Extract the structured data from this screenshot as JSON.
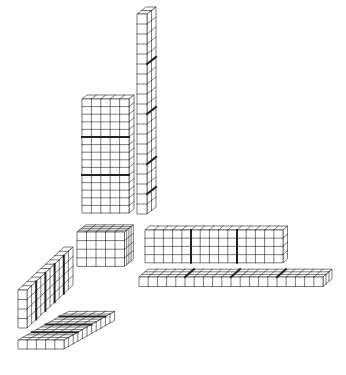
{
  "figure": {
    "width": 346,
    "height": 375,
    "background": "#ffffff",
    "line_color": "#222222",
    "face_color": "#ffffff",
    "thin_stroke": 0.6,
    "thick_stroke": 2.0
  },
  "blocks": [
    {
      "name": "tall-column",
      "x": 137,
      "y": 14,
      "cols": 1,
      "rows": 20,
      "depth": 2,
      "cw": 10,
      "rh": 10,
      "dx": 4.5,
      "dy": -3.5,
      "thick_side_rows": [
        5,
        10,
        15,
        18
      ]
    },
    {
      "name": "tall-slab",
      "x": 82,
      "y": 99,
      "cols": 5,
      "rows": 15,
      "depth": 1,
      "cw": 9.4,
      "rh": 7.6,
      "dx": 5,
      "dy": -4,
      "thick_front_rows": [
        5,
        10
      ]
    },
    {
      "name": "small-cube",
      "x": 77,
      "y": 232,
      "cols": 5,
      "rows": 4,
      "depth": 4,
      "cw": 9.5,
      "rh": 8.6,
      "dx": 2.2,
      "dy": -1.8
    },
    {
      "name": "wide-wall",
      "x": 145,
      "y": 230,
      "cols": 15,
      "rows": 4,
      "depth": 1,
      "cw": 9.2,
      "rh": 8.2,
      "dx": 4.5,
      "dy": -4,
      "thick_front_cols": [
        5,
        10
      ]
    },
    {
      "name": "long-bar",
      "x": 139,
      "y": 277,
      "cols": 20,
      "rows": 1,
      "depth": 3,
      "cw": 9.2,
      "rh": 9.5,
      "dx": 3.0,
      "dy": -2.6,
      "thick_top_cols": [
        5,
        10,
        15
      ]
    },
    {
      "name": "left-wall",
      "x": 18,
      "y": 290,
      "cols": 1,
      "rows": 4,
      "depth": 10,
      "cw": 9,
      "rh": 9.5,
      "dx": 4.6,
      "dy": -4.3,
      "thick_side_depths": [
        2,
        4,
        6,
        8
      ]
    },
    {
      "name": "floor-slab",
      "x": 18,
      "y": 340,
      "cols": 5,
      "rows": 1,
      "depth": 11,
      "cw": 9.2,
      "rh": 9,
      "dx": 4.6,
      "dy": -2.6,
      "thick_top_depths": [
        3,
        6,
        9
      ]
    }
  ]
}
